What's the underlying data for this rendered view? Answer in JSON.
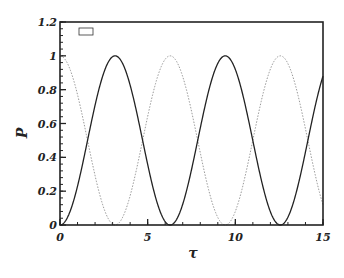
{
  "chart_data": {
    "type": "line",
    "title": "",
    "xlabel": "τ",
    "ylabel": "P",
    "xlim": [
      0,
      15
    ],
    "ylim": [
      0,
      1.2
    ],
    "x_ticks": [
      "0",
      "5",
      "10",
      "15"
    ],
    "y_ticks": [
      "0",
      "0.2",
      "0.4",
      "0.6",
      "0.8",
      "1",
      "1.2"
    ],
    "grid": false,
    "legend": {
      "position": "upper-left",
      "entries": []
    },
    "series": [
      {
        "name": "solid",
        "style": "solid",
        "color": "#222222",
        "formula": "sin^2(tau/2)",
        "x": [
          0,
          1,
          1.5708,
          2,
          3.1416,
          4,
          4.7124,
          5,
          6.2832,
          7,
          7.854,
          8,
          9.4248,
          10,
          10.9956,
          11,
          12.5664,
          13,
          14.1372,
          15
        ],
        "values": [
          0,
          0.23,
          0.5,
          0.71,
          1,
          0.71,
          0.5,
          0.4,
          0,
          0.19,
          0.5,
          0.57,
          1,
          0.92,
          0.5,
          0.5,
          0,
          0.05,
          0.5,
          0.87
        ]
      },
      {
        "name": "dotted",
        "style": "dotted",
        "color": "#888888",
        "formula": "cos^2(tau/2)",
        "x": [
          0,
          1,
          1.5708,
          2,
          3.1416,
          4,
          4.7124,
          5,
          6.2832,
          7,
          7.854,
          8,
          9.4248,
          10,
          10.9956,
          11,
          12.5664,
          13,
          14.1372,
          15
        ],
        "values": [
          1,
          0.77,
          0.5,
          0.29,
          0,
          0.29,
          0.5,
          0.6,
          1,
          0.81,
          0.5,
          0.43,
          0,
          0.08,
          0.5,
          0.5,
          1,
          0.95,
          0.5,
          0.13
        ]
      }
    ]
  },
  "axes": {
    "x_label": "τ",
    "y_label": "P",
    "x_ticks": [
      {
        "value": 0,
        "label": "0"
      },
      {
        "value": 5,
        "label": "5"
      },
      {
        "value": 10,
        "label": "10"
      },
      {
        "value": 15,
        "label": "15"
      }
    ],
    "y_ticks": [
      {
        "value": 0,
        "label": "0"
      },
      {
        "value": 0.2,
        "label": "0.2"
      },
      {
        "value": 0.4,
        "label": "0.4"
      },
      {
        "value": 0.6,
        "label": "0.6"
      },
      {
        "value": 0.8,
        "label": "0.8"
      },
      {
        "value": 1,
        "label": "1"
      },
      {
        "value": 1.2,
        "label": "1.2"
      }
    ]
  },
  "plot": {
    "left": 60,
    "right": 323,
    "top": 22,
    "bottom": 225,
    "frame_color": "#222222",
    "legend_box": {
      "x": 79,
      "y": 28,
      "w": 14,
      "h": 7
    }
  }
}
